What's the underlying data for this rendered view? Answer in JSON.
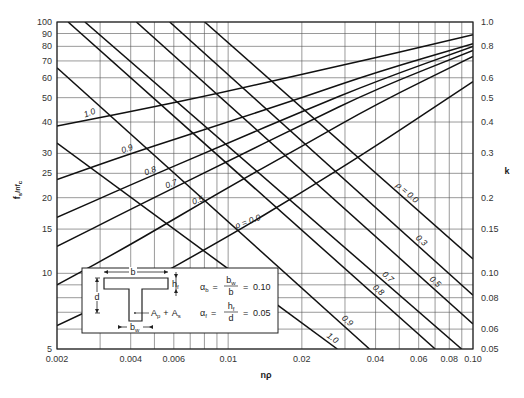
{
  "chart_data": {
    "type": "line",
    "title": "",
    "xlabel": "nρ",
    "ylabel_left": "fs/nfc",
    "ylabel_right": "k",
    "xscale": "log",
    "yscale": "log",
    "xlim": [
      0.002,
      0.1
    ],
    "ylim_left": [
      5,
      100
    ],
    "ylim_right": [
      0.05,
      1.0
    ],
    "grid": true,
    "x_ticks": [
      {
        "v": 0.002,
        "label": "0.002"
      },
      {
        "v": 0.004,
        "label": "0.004"
      },
      {
        "v": 0.006,
        "label": "0.006"
      },
      {
        "v": 0.01,
        "label": "0.01"
      },
      {
        "v": 0.02,
        "label": "0.02"
      },
      {
        "v": 0.04,
        "label": "0.04"
      },
      {
        "v": 0.06,
        "label": "0.06"
      },
      {
        "v": 0.08,
        "label": "0.08"
      },
      {
        "v": 0.1,
        "label": "0.10"
      }
    ],
    "x_grid": [
      0.002,
      0.003,
      0.004,
      0.005,
      0.006,
      0.007,
      0.008,
      0.009,
      0.01,
      0.02,
      0.03,
      0.04,
      0.05,
      0.06,
      0.07,
      0.08,
      0.09,
      0.1
    ],
    "y_left_ticks": [
      {
        "v": 100,
        "label": "100"
      },
      {
        "v": 90,
        "label": "90"
      },
      {
        "v": 80,
        "label": "80"
      },
      {
        "v": 70,
        "label": "70"
      },
      {
        "v": 60,
        "label": "60"
      },
      {
        "v": 50,
        "label": "50"
      },
      {
        "v": 40,
        "label": "40"
      },
      {
        "v": 30,
        "label": "30"
      },
      {
        "v": 25,
        "label": "25"
      },
      {
        "v": 20,
        "label": "20"
      },
      {
        "v": 15,
        "label": "15"
      },
      {
        "v": 10,
        "label": "10"
      },
      {
        "v": 5,
        "label": "5"
      }
    ],
    "y_grid": [
      100,
      90,
      80,
      70,
      60,
      50,
      40,
      30,
      25,
      20,
      15,
      10,
      9,
      8,
      7,
      6,
      5
    ],
    "y_right_ticks": [
      {
        "v": 1.0,
        "label": "1.0"
      },
      {
        "v": 0.8,
        "label": "0.8"
      },
      {
        "v": 0.6,
        "label": "0.6"
      },
      {
        "v": 0.5,
        "label": "0.5"
      },
      {
        "v": 0.4,
        "label": "0.4"
      },
      {
        "v": 0.3,
        "label": "0.3"
      },
      {
        "v": 0.2,
        "label": "0.2"
      },
      {
        "v": 0.15,
        "label": "0.15"
      },
      {
        "v": 0.1,
        "label": "0.10"
      },
      {
        "v": 0.08,
        "label": "0.08"
      },
      {
        "v": 0.06,
        "label": "0.06"
      },
      {
        "v": 0.05,
        "label": "0.05"
      }
    ],
    "series_fs_nfc": [
      {
        "name": "ρ = 1.0",
        "label": "1.0",
        "points": [
          [
            0.002,
            33.0
          ],
          [
            0.0279,
            5.0
          ]
        ]
      },
      {
        "name": "ρ = 0.9",
        "label": "0.9",
        "points": [
          [
            0.002,
            65.8
          ],
          [
            0.0378,
            5.0
          ]
        ]
      },
      {
        "name": "ρ = 0.8",
        "label": "0.8",
        "points": [
          [
            0.00222,
            100
          ],
          [
            0.0701,
            5.0
          ]
        ]
      },
      {
        "name": "ρ = 0.7",
        "label": "0.7",
        "points": [
          [
            0.0026,
            100
          ],
          [
            0.0898,
            5.0
          ]
        ]
      },
      {
        "name": "ρ = 0.5",
        "label": "0.5",
        "points": [
          [
            0.00422,
            100
          ],
          [
            0.1,
            6.29
          ]
        ]
      },
      {
        "name": "ρ = 0.3",
        "label": "0.3",
        "points": [
          [
            0.00577,
            100
          ],
          [
            0.1,
            8.18
          ]
        ]
      },
      {
        "name": "ρ = 0.0",
        "label": "ρ = 0.0",
        "points": [
          [
            0.00802,
            100
          ],
          [
            0.1,
            11.4
          ]
        ]
      }
    ],
    "series_k": [
      {
        "name": "ρ = 1.0",
        "label": "1.0",
        "points": [
          [
            0.002,
            0.386
          ],
          [
            0.004,
            0.44
          ],
          [
            0.01,
            0.53
          ],
          [
            0.02,
            0.62
          ],
          [
            0.04,
            0.72
          ],
          [
            0.1,
            0.89
          ]
        ]
      },
      {
        "name": "ρ = 0.9",
        "label": "0.9",
        "points": [
          [
            0.002,
            0.236
          ],
          [
            0.004,
            0.3
          ],
          [
            0.01,
            0.4
          ],
          [
            0.02,
            0.5
          ],
          [
            0.04,
            0.63
          ],
          [
            0.1,
            0.82
          ]
        ]
      },
      {
        "name": "ρ = 0.8",
        "label": "0.8",
        "points": [
          [
            0.002,
            0.167
          ],
          [
            0.004,
            0.225
          ],
          [
            0.01,
            0.33
          ],
          [
            0.02,
            0.44
          ],
          [
            0.04,
            0.58
          ],
          [
            0.1,
            0.8
          ]
        ]
      },
      {
        "name": "ρ = 0.7",
        "label": "0.7",
        "points": [
          [
            0.002,
            0.128
          ],
          [
            0.004,
            0.18
          ],
          [
            0.01,
            0.28
          ],
          [
            0.02,
            0.39
          ],
          [
            0.04,
            0.54
          ],
          [
            0.1,
            0.77
          ]
        ]
      },
      {
        "name": "ρ = 0.5",
        "label": "0.5",
        "points": [
          [
            0.002,
            0.09
          ],
          [
            0.004,
            0.13
          ],
          [
            0.01,
            0.22
          ],
          [
            0.02,
            0.32
          ],
          [
            0.04,
            0.47
          ],
          [
            0.1,
            0.73
          ]
        ]
      },
      {
        "name": "ρ = 0.0",
        "label": "ρ = 0.0",
        "points": [
          [
            0.002,
            0.062
          ],
          [
            0.004,
            0.085
          ],
          [
            0.01,
            0.14
          ],
          [
            0.02,
            0.21
          ],
          [
            0.04,
            0.32
          ],
          [
            0.1,
            0.58
          ]
        ]
      }
    ],
    "inset": {
      "b_label": "b",
      "hf_label": "h",
      "hf_sub": "f",
      "d_label": "d",
      "bw_label": "b",
      "bw_sub": "w",
      "steel_label": "A",
      "steel_sub_p": "p",
      "steel_plus": "+",
      "steel_label2": "A",
      "steel_sub_s": "s",
      "alpha_b": {
        "sym": "α",
        "sub": "b",
        "num": "b",
        "num_sub": "w",
        "den": "b",
        "value": "0.10"
      },
      "alpha_f": {
        "sym": "α",
        "sub": "f",
        "num": "h",
        "num_sub": "f",
        "den": "d",
        "value": "0.05"
      }
    }
  },
  "labels": {
    "x_axis": "nρ",
    "y_left_main": "f",
    "y_left_sub": "s",
    "y_left_rest": "/nf",
    "y_left_sub2": "c",
    "y_right": "k"
  }
}
